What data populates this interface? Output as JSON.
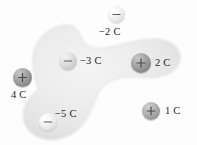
{
  "figure": {
    "background_color": "#fdfdfd",
    "surface": {
      "name": "gaussian-surface",
      "fill_color": "#e9e9e9",
      "edge_color": "#d8d8d8"
    },
    "charges": [
      {
        "id": "minus-2c",
        "label": "−2 C",
        "sign": "−",
        "sign_name": "minus-sign",
        "value": -2,
        "unit": "C",
        "inside_surface": false,
        "sphere_tone": "light",
        "cx": 116,
        "cy": 14,
        "r": 8.5,
        "label_x": 99,
        "label_y": 26
      },
      {
        "id": "minus-3c",
        "label": "−3 C",
        "sign": "−",
        "sign_name": "minus-sign",
        "value": -3,
        "unit": "C",
        "inside_surface": true,
        "sphere_tone": "mid",
        "cx": 68,
        "cy": 61,
        "r": 9,
        "label_x": 80,
        "label_y": 55
      },
      {
        "id": "plus-2c",
        "label": "2 C",
        "sign": "+",
        "sign_name": "plus-sign",
        "value": 2,
        "unit": "C",
        "inside_surface": true,
        "sphere_tone": "dark",
        "cx": 141,
        "cy": 63,
        "r": 10,
        "label_x": 155,
        "label_y": 57
      },
      {
        "id": "plus-4c",
        "label": "4 C",
        "sign": "+",
        "sign_name": "plus-sign",
        "value": 4,
        "unit": "C",
        "inside_surface": false,
        "sphere_tone": "dark",
        "cx": 22,
        "cy": 77,
        "r": 9.5,
        "label_x": 11,
        "label_y": 89
      },
      {
        "id": "minus-5c",
        "label": "−5 C",
        "sign": "−",
        "sign_name": "minus-sign",
        "value": -5,
        "unit": "C",
        "inside_surface": true,
        "sphere_tone": "light",
        "cx": 48,
        "cy": 122,
        "r": 9,
        "label_x": 55,
        "label_y": 108
      },
      {
        "id": "plus-1c",
        "label": "1 C",
        "sign": "+",
        "sign_name": "plus-sign",
        "value": 1,
        "unit": "C",
        "inside_surface": false,
        "sphere_tone": "mid",
        "cx": 151,
        "cy": 111,
        "r": 9,
        "label_x": 165,
        "label_y": 105
      }
    ]
  }
}
